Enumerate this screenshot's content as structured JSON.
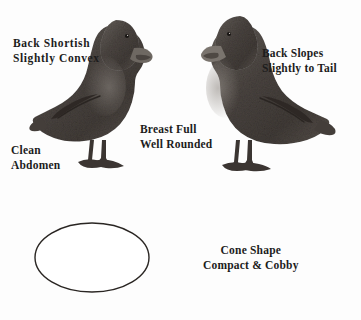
{
  "figure": {
    "background_color": "#fdfdfd",
    "ink_color": "#1c1c1c",
    "plumage_color": "#4a4440"
  },
  "annotations": {
    "back_shortish": {
      "line1": "Back  Shortish",
      "line2": "Slightly  Convex"
    },
    "back_slopes": {
      "line1": "Back Slopes",
      "line2": "Slightly to Tail"
    },
    "breast_full": {
      "line1": "Breast Full",
      "line2": "Well Rounded"
    },
    "clean_abdomen": {
      "line1": "Clean",
      "line2": "Abdomen"
    },
    "cone_shape": {
      "line1": "Cone Shape",
      "line2": "Compact & Cobby"
    }
  },
  "illustrations": {
    "duck_left": "duck-facing-right-illustration",
    "duck_right": "duck-facing-left-illustration",
    "body_outline": "oval-body-outline-illustration"
  }
}
